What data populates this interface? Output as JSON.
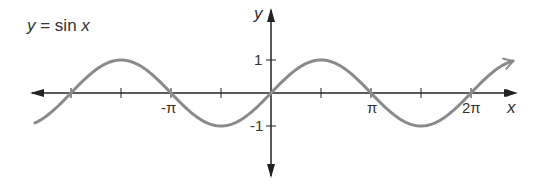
{
  "title": "y = sin x",
  "chart_data": {
    "type": "line",
    "title": "y = sin x",
    "function": "sin(x)",
    "xlabel": "x",
    "ylabel": "y",
    "x_range": [
      -2.36,
      2.42
    ],
    "x_range_units": "pi",
    "ylim": [
      -1,
      1
    ],
    "x_ticks": [
      -2,
      -1.5,
      -1,
      -0.5,
      0,
      0.5,
      1,
      1.5,
      2
    ],
    "x_tick_labels": [
      {
        "value": -1,
        "label": "-π"
      },
      {
        "value": 1,
        "label": "π"
      },
      {
        "value": 2,
        "label": "2π"
      }
    ],
    "y_tick_labels": [
      {
        "value": 1,
        "label": "1"
      },
      {
        "value": -1,
        "label": "-1"
      }
    ],
    "series": [
      {
        "name": "y = sin x",
        "color": "#8a8a8a"
      }
    ],
    "axis_color": "#222222",
    "grid": false,
    "legend": "none"
  },
  "labels": {
    "x_axis": "x",
    "y_axis": "y",
    "neg_pi": "-π",
    "pi": "π",
    "two_pi": "2π",
    "one": "1",
    "neg_one": "-1"
  }
}
